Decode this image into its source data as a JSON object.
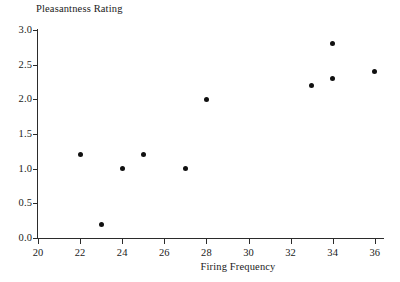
{
  "figure": {
    "clipped_top_text": "",
    "background_color": "#ffffff",
    "marker_color": "#101010",
    "axis_color": "#2b2b2b"
  },
  "chart_data": {
    "type": "scatter",
    "title": "",
    "xlabel": "Firing Frequency",
    "ylabel": "Pleasantness Rating",
    "xlim": [
      20,
      36.3
    ],
    "ylim": [
      0.0,
      3.0
    ],
    "grid": false,
    "legend": null,
    "x_ticks": [
      20,
      22,
      24,
      26,
      28,
      30,
      32,
      34,
      36
    ],
    "x_ticklabels": [
      "20",
      "22",
      "24",
      "26",
      "28",
      "30",
      "32",
      "34",
      "36"
    ],
    "y_ticks": [
      0.0,
      0.5,
      1.0,
      1.5,
      2.0,
      2.5,
      3.0
    ],
    "y_ticklabels": [
      "0.0",
      "0.5",
      "1.0",
      "1.5",
      "2.0",
      "2.5",
      "3.0"
    ],
    "points": [
      {
        "x": 22,
        "y": 1.2
      },
      {
        "x": 23,
        "y": 0.2
      },
      {
        "x": 24,
        "y": 1.0
      },
      {
        "x": 25,
        "y": 1.2
      },
      {
        "x": 27,
        "y": 1.0
      },
      {
        "x": 28,
        "y": 2.0
      },
      {
        "x": 33,
        "y": 2.2
      },
      {
        "x": 34,
        "y": 2.3
      },
      {
        "x": 34,
        "y": 2.8
      },
      {
        "x": 36,
        "y": 2.4
      }
    ]
  }
}
